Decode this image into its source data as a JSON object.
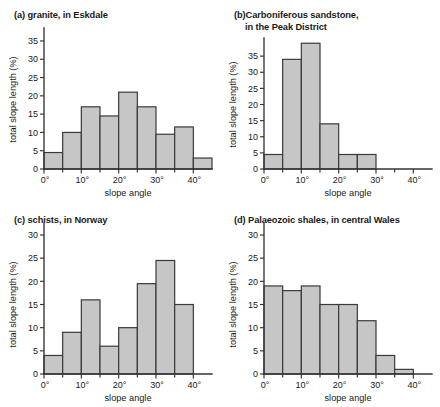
{
  "figure": {
    "top_cropped_line": "",
    "bar_fill_color": "#c6c6c6",
    "bar_stroke_color": "#3a3a3a",
    "axis_color": "#333333",
    "background_color": "#ffffff"
  },
  "panels": [
    {
      "key": "a",
      "title_line1": "(a) granite, in Eskdale",
      "title_line2": "",
      "chart_data": {
        "type": "bar",
        "title": "(a) granite, in Eskdale",
        "xlabel": "slope angle",
        "ylabel": "total slope length (%)",
        "categories": [
          "0°–5°",
          "5°–10°",
          "10°–15°",
          "15°–20°",
          "20°–25°",
          "25°–30°",
          "30°–35°",
          "35°–40°",
          "40°–45°"
        ],
        "bin_starts": [
          0,
          5,
          10,
          15,
          20,
          25,
          30,
          35,
          40
        ],
        "bin_width": 5,
        "values": [
          4.5,
          10,
          17,
          14.5,
          21,
          17,
          9.5,
          11.5,
          3
        ],
        "xlim": [
          0,
          45
        ],
        "ylim": [
          0,
          38
        ],
        "ytickvals": [
          0,
          5,
          10,
          15,
          20,
          25,
          30,
          35
        ],
        "yticklabels": [
          "0",
          "5",
          "10",
          "15",
          "20",
          "25",
          "30",
          "35"
        ],
        "xtickvals": [
          0,
          10,
          20,
          30,
          40
        ],
        "xticklabels": [
          "0°",
          "10°",
          "20°",
          "30°",
          "40°"
        ],
        "xminorticks": [
          5,
          15,
          25,
          35
        ],
        "grid": false,
        "legend": "none"
      }
    },
    {
      "key": "b",
      "title_line1": "(b)Carboniferous sandstone,",
      "title_line2": "in the Peak District",
      "chart_data": {
        "type": "bar",
        "title": "(b) Carboniferous sandstone, in the Peak District",
        "xlabel": "slope angle",
        "ylabel": "total slope length (%)",
        "categories": [
          "0°–5°",
          "5°–10°",
          "10°–15°",
          "15°–20°",
          "20°–25°",
          "25°–30°"
        ],
        "bin_starts": [
          0,
          5,
          10,
          15,
          20,
          25
        ],
        "bin_width": 5,
        "values": [
          4.5,
          34,
          39,
          14,
          4.5,
          4.5
        ],
        "xlim": [
          0,
          45
        ],
        "ylim": [
          0,
          40
        ],
        "ytickvals": [
          0,
          5,
          10,
          15,
          20,
          25,
          30,
          35
        ],
        "yticklabels": [
          "0",
          "5",
          "10",
          "15",
          "20",
          "25",
          "30",
          "35"
        ],
        "xtickvals": [
          0,
          10,
          20,
          30,
          40
        ],
        "xticklabels": [
          "0°",
          "10°",
          "20°",
          "30°",
          "40°"
        ],
        "xminorticks": [
          5,
          15,
          25,
          35
        ],
        "grid": false,
        "legend": "none"
      }
    },
    {
      "key": "c",
      "title_line1": "(c) schists, in Norway",
      "title_line2": "",
      "chart_data": {
        "type": "bar",
        "title": "(c) schists, in Norway",
        "xlabel": "slope angle",
        "ylabel": "total slope length (%)",
        "categories": [
          "0°–5°",
          "5°–10°",
          "10°–15°",
          "15°–20°",
          "20°–25°",
          "25°–30°",
          "30°–35°",
          "35°–40°"
        ],
        "bin_starts": [
          0,
          5,
          10,
          15,
          20,
          25,
          30,
          35
        ],
        "bin_width": 5,
        "values": [
          4,
          9,
          16,
          6,
          10,
          19.5,
          24.5,
          15
        ],
        "xlim": [
          0,
          45
        ],
        "ylim": [
          0,
          30
        ],
        "ytickvals": [
          0,
          5,
          10,
          15,
          20,
          25,
          30
        ],
        "yticklabels": [
          "0",
          "5",
          "10",
          "15",
          "20",
          "25",
          "30"
        ],
        "xtickvals": [
          0,
          10,
          20,
          30,
          40
        ],
        "xticklabels": [
          "0°",
          "10°",
          "20°",
          "30°",
          "40°"
        ],
        "xminorticks": [
          5,
          15,
          25,
          35
        ],
        "grid": false,
        "legend": "none"
      }
    },
    {
      "key": "d",
      "title_line1": "(d) Palaeozoic shales, in central Wales",
      "title_line2": "",
      "chart_data": {
        "type": "bar",
        "title": "(d) Palaeozoic shales, in central Wales",
        "xlabel": "slope angle",
        "ylabel": "total slope length (%)",
        "categories": [
          "0°–5°",
          "5°–10°",
          "10°–15°",
          "15°–20°",
          "20°–25°",
          "25°–30°",
          "30°–35°",
          "35°–40°"
        ],
        "bin_starts": [
          0,
          5,
          10,
          15,
          20,
          25,
          30,
          35
        ],
        "bin_width": 5,
        "values": [
          19,
          18,
          19,
          15,
          15,
          11.5,
          4,
          1
        ],
        "xlim": [
          0,
          45
        ],
        "ylim": [
          0,
          30
        ],
        "ytickvals": [
          0,
          5,
          10,
          15,
          20,
          25,
          30
        ],
        "yticklabels": [
          "0",
          "5",
          "10",
          "15",
          "20",
          "25",
          "30"
        ],
        "xtickvals": [
          0,
          10,
          20,
          30,
          40
        ],
        "xticklabels": [
          "0°",
          "10°",
          "20°",
          "30°",
          "40°"
        ],
        "xminorticks": [
          5,
          15,
          25,
          35
        ],
        "grid": false,
        "legend": "none"
      }
    }
  ]
}
